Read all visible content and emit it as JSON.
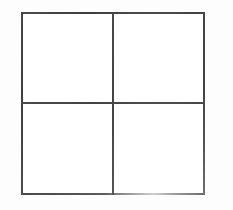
{
  "figure": {
    "name": "2x2-grid",
    "shape": "square",
    "rows": 2,
    "columns": 2,
    "cell_count": 4,
    "line_color": "#4a4a4a",
    "fill_color": "#ffffff",
    "background_color": "#ffffff",
    "line_width_px": 2,
    "outer_left_px": 21,
    "outer_top_px": 12,
    "outer_width_px": 184,
    "outer_height_px": 183,
    "divider_vertical_x_px": 113,
    "divider_horizontal_y_px": 102
  },
  "edges": {
    "top_label": "",
    "right_label": "",
    "bottom_label": "",
    "left_label": ""
  },
  "dividers": {
    "vertical_label": "",
    "horizontal_label": ""
  },
  "cells": [
    {
      "id": "top-left",
      "label": "",
      "row": 1,
      "column": 1,
      "content": ""
    },
    {
      "id": "top-right",
      "label": "",
      "row": 1,
      "column": 2,
      "content": ""
    },
    {
      "id": "bottom-left",
      "label": "",
      "row": 2,
      "column": 1,
      "content": ""
    },
    {
      "id": "bottom-right",
      "label": "",
      "row": 2,
      "column": 2,
      "content": ""
    }
  ]
}
